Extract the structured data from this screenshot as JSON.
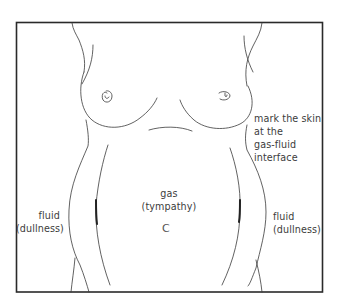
{
  "figure": {
    "type": "medical-illustration",
    "colors": {
      "background": "#ffffff",
      "frame": "#2a2a2a",
      "outline": "#3a3a3a",
      "text": "#3c3c3c"
    }
  },
  "labels": {
    "marker": [
      "mark the skin",
      "at the",
      "gas-fluid",
      "interface"
    ],
    "fluid_left": [
      "fluid",
      "(dullness)"
    ],
    "gas": [
      "gas",
      "(tympathy)"
    ],
    "fluid_right": [
      "fluid",
      "(dullness)"
    ],
    "navel": "C"
  }
}
